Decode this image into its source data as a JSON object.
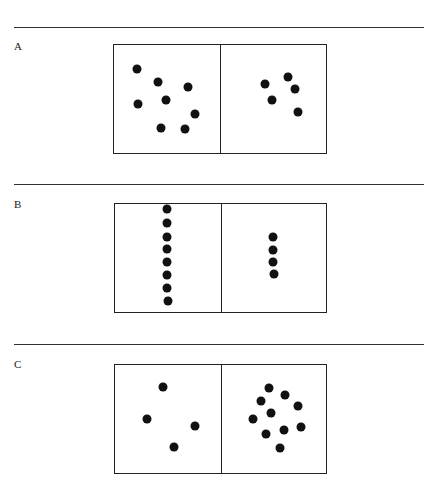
{
  "panels": [
    {
      "label": "A",
      "rule_y": 27,
      "label_y": 40,
      "box": {
        "left": 113,
        "top": 44,
        "divider": 220,
        "right": 327,
        "bottom": 154
      },
      "left_dots": [
        [
          137,
          69
        ],
        [
          158,
          82
        ],
        [
          188,
          87
        ],
        [
          138,
          104
        ],
        [
          166,
          100
        ],
        [
          195,
          114
        ],
        [
          161,
          128
        ],
        [
          185,
          129
        ]
      ],
      "right_dots": [
        [
          265,
          84
        ],
        [
          288,
          77
        ],
        [
          295,
          89
        ],
        [
          272,
          100
        ],
        [
          298,
          112
        ]
      ]
    },
    {
      "label": "B",
      "rule_y": 184,
      "label_y": 198,
      "box": {
        "left": 114,
        "top": 203,
        "divider": 221,
        "right": 327,
        "bottom": 313
      },
      "left_dots": [
        [
          167,
          209
        ],
        [
          167,
          223
        ],
        [
          167,
          237
        ],
        [
          167,
          249
        ],
        [
          167,
          262
        ],
        [
          167,
          275
        ],
        [
          167,
          288
        ],
        [
          168,
          301
        ]
      ],
      "right_dots": [
        [
          273,
          237
        ],
        [
          273,
          250
        ],
        [
          273,
          262
        ],
        [
          274,
          274
        ]
      ]
    },
    {
      "label": "C",
      "rule_y": 344,
      "label_y": 358,
      "box": {
        "left": 114,
        "top": 364,
        "divider": 221,
        "right": 327,
        "bottom": 474
      },
      "left_dots": [
        [
          163,
          387
        ],
        [
          147,
          419
        ],
        [
          195,
          426
        ],
        [
          174,
          447
        ]
      ],
      "right_dots": [
        [
          269,
          388
        ],
        [
          285,
          395
        ],
        [
          261,
          401
        ],
        [
          298,
          406
        ],
        [
          271,
          413
        ],
        [
          253,
          419
        ],
        [
          301,
          427
        ],
        [
          266,
          434
        ],
        [
          284,
          430
        ],
        [
          280,
          448
        ]
      ]
    }
  ],
  "dot_counts": {
    "A": {
      "left": 8,
      "right": 5
    },
    "B": {
      "left": 8,
      "right": 4
    },
    "C": {
      "left": 4,
      "right": 10
    }
  }
}
